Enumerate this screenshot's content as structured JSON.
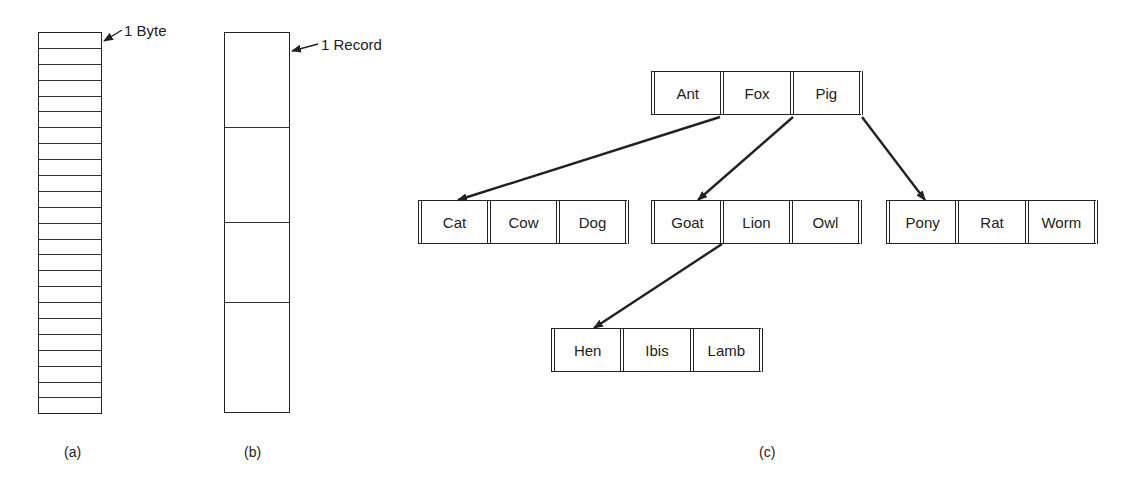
{
  "panel_a": {
    "caption": "(a)",
    "annotation": "1 Byte",
    "byte_cell_count": 24
  },
  "panel_b": {
    "caption": "(b)",
    "annotation": "1 Record",
    "record_heights": [
      95,
      95,
      80,
      111
    ]
  },
  "panel_c": {
    "caption": "(c)",
    "tree": {
      "root": {
        "keys": [
          "Ant",
          "Fox",
          "Pig"
        ]
      },
      "level1": [
        {
          "keys": [
            "Cat",
            "Cow",
            "Dog"
          ]
        },
        {
          "keys": [
            "Goat",
            "Lion",
            "Owl"
          ]
        },
        {
          "keys": [
            "Pony",
            "Rat",
            "Worm"
          ]
        }
      ],
      "level2": [
        {
          "keys": [
            "Hen",
            "Ibis",
            "Lamb"
          ]
        }
      ]
    }
  },
  "colors": {
    "line": "#222222",
    "background": "#ffffff"
  }
}
